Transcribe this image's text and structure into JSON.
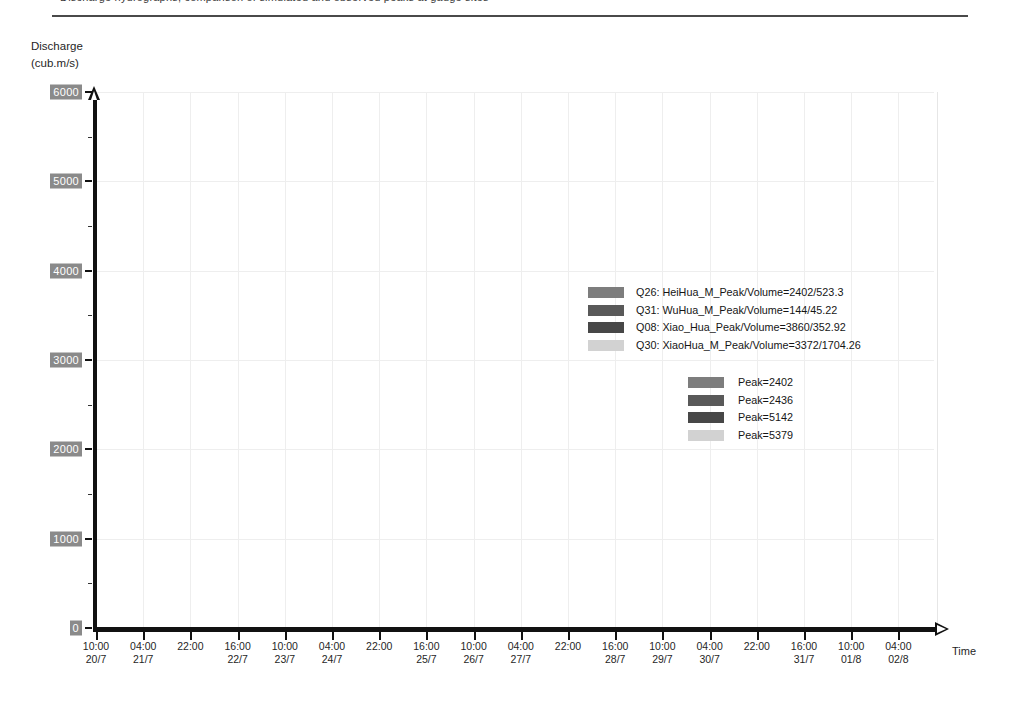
{
  "header": {
    "clipped_text": "Discharge hydrographs, comparison of simulated and observed peaks at gauge sites"
  },
  "axes": {
    "y_title_line1": "Discharge",
    "y_title_line2": "(cub.m/s)",
    "x_title": "Time"
  },
  "legend1": {
    "items": [
      {
        "label": "Q26: HeiHua_M_Peak/Volume=2402/523.3",
        "color": "#7d7d7d"
      },
      {
        "label": "Q31: WuHua_M_Peak/Volume=144/45.22",
        "color": "#595959"
      },
      {
        "label": "Q08: Xiao_Hua_Peak/Volume=3860/352.92",
        "color": "#474747"
      },
      {
        "label": "Q30: XiaoHua_M_Peak/Volume=3372/1704.26",
        "color": "#d2d2d2"
      }
    ]
  },
  "legend2": {
    "items": [
      {
        "label": "Peak=2402",
        "color": "#7d7d7d"
      },
      {
        "label": "Peak=2436",
        "color": "#595959"
      },
      {
        "label": "Peak=5142",
        "color": "#474747"
      },
      {
        "label": "Peak=5379",
        "color": "#d2d2d2"
      }
    ]
  },
  "chart_data": {
    "type": "area",
    "title": "",
    "xlabel": "Time",
    "ylabel": "Discharge (cub.m/s)",
    "ylim": [
      0,
      6000
    ],
    "yticks": [
      0,
      1000,
      2000,
      3000,
      4000,
      5000,
      6000
    ],
    "yticks_minor": [
      500,
      1500,
      2500,
      3500,
      4500,
      5500
    ],
    "grid": true,
    "legend_position": "right",
    "x_tick_labels": [
      {
        "time": "10:00",
        "date": "20/7"
      },
      {
        "time": "04:00",
        "date": "21/7"
      },
      {
        "time": "22:00",
        "date": ""
      },
      {
        "time": "16:00",
        "date": "22/7"
      },
      {
        "time": "10:00",
        "date": "23/7"
      },
      {
        "time": "04:00",
        "date": "24/7"
      },
      {
        "time": "22:00",
        "date": ""
      },
      {
        "time": "16:00",
        "date": "25/7"
      },
      {
        "time": "10:00",
        "date": "26/7"
      },
      {
        "time": "04:00",
        "date": "27/7"
      },
      {
        "time": "22:00",
        "date": ""
      },
      {
        "time": "16:00",
        "date": "28/7"
      },
      {
        "time": "10:00",
        "date": "29/7"
      },
      {
        "time": "04:00",
        "date": "30/7"
      },
      {
        "time": "22:00",
        "date": ""
      },
      {
        "time": "16:00",
        "date": "31/7"
      },
      {
        "time": "10:00",
        "date": "01/8"
      },
      {
        "time": "04:00",
        "date": "02/8"
      }
    ],
    "series": [
      {
        "name": "Q30: XiaoHua_M",
        "peak": 5379,
        "volume": 1704.26,
        "color": "#d2d2d2",
        "values": [
          30,
          60,
          120,
          260,
          520,
          900,
          1500,
          2350,
          3500,
          4700,
          5379,
          5100,
          4450,
          4080,
          3980,
          4070,
          3930,
          3880,
          3960,
          4060,
          4080,
          4080,
          4060,
          4000,
          3720,
          3250,
          2980,
          2930,
          2900,
          2760,
          2450,
          2120,
          1880,
          1700,
          1560,
          1460,
          1400,
          1350,
          1320,
          1300,
          1285,
          1275,
          1268,
          1262,
          1258,
          1255,
          1252,
          1250,
          1250,
          1252,
          1255,
          1258,
          1260,
          1262,
          1265
        ]
      },
      {
        "name": "Q08: Xiao_Hua",
        "peak": 5142,
        "volume": 352.92,
        "color": "#474747",
        "values": [
          18,
          35,
          80,
          190,
          420,
          780,
          1350,
          2200,
          3350,
          4600,
          5142,
          4780,
          4050,
          3380,
          2860,
          2500,
          2280,
          2200,
          2230,
          2360,
          2430,
          2436,
          2360,
          2160,
          1880,
          1560,
          1280,
          1050,
          880,
          740,
          630,
          545,
          480,
          430,
          390,
          360,
          335,
          315,
          300,
          288,
          278,
          270,
          264,
          258,
          254,
          250,
          247,
          245,
          243,
          242,
          241,
          240,
          240,
          240,
          240
        ]
      },
      {
        "name": "Q26: HeiHua_M",
        "peak": 2402,
        "volume": 523.3,
        "color": "#7d7d7d",
        "values": [
          10,
          20,
          45,
          105,
          230,
          420,
          720,
          1080,
          1380,
          1560,
          1660,
          1760,
          1880,
          2000,
          2130,
          2250,
          2340,
          2390,
          2402,
          2380,
          2310,
          2190,
          2000,
          1760,
          1500,
          1250,
          1030,
          850,
          710,
          600,
          515,
          450,
          400,
          360,
          330,
          305,
          288,
          272,
          260,
          250,
          242,
          236,
          230,
          226,
          222,
          219,
          217,
          215,
          213,
          212,
          211,
          210,
          210,
          210,
          210
        ]
      },
      {
        "name": "Q31: WuHua_M",
        "peak": 144,
        "volume": 45.22,
        "color": "#595959",
        "values": [
          3,
          6,
          12,
          26,
          48,
          76,
          105,
          128,
          140,
          144,
          140,
          132,
          122,
          112,
          104,
          97,
          91,
          86,
          82,
          79,
          76,
          73,
          70,
          67,
          64,
          61,
          58,
          55,
          53,
          51,
          49,
          47,
          45,
          44,
          43,
          42,
          41,
          40,
          39,
          38,
          38,
          37,
          37,
          36,
          36,
          36,
          35,
          35,
          35,
          35,
          35,
          35,
          35,
          35,
          35
        ]
      }
    ]
  }
}
